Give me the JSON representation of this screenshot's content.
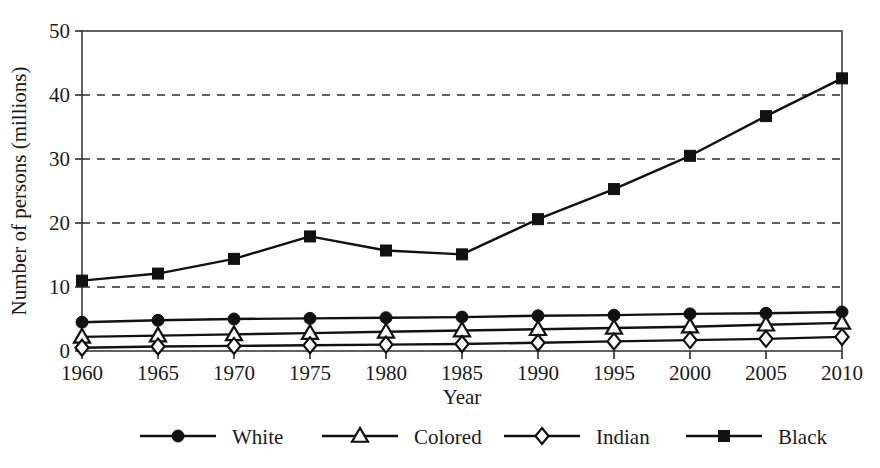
{
  "chart_data": {
    "type": "line",
    "title": "",
    "xlabel": "Year",
    "ylabel": "Number of persons (millions)",
    "x": [
      1960,
      1965,
      1970,
      1975,
      1980,
      1985,
      1990,
      1995,
      2000,
      2005,
      2010
    ],
    "categories": [
      "1960",
      "1965",
      "1970",
      "1975",
      "1980",
      "1985",
      "1990",
      "1995",
      "2000",
      "2005",
      "2010"
    ],
    "xlim": [
      1960,
      2010
    ],
    "ylim": [
      0,
      50
    ],
    "yticks": [
      0,
      10,
      20,
      30,
      40,
      50
    ],
    "ytick_labels": [
      "0",
      "10",
      "20",
      "30",
      "40",
      "50"
    ],
    "grid": "horizontal-dashed",
    "legend_position": "bottom",
    "series": [
      {
        "name": "White",
        "marker": "filled-circle",
        "color": "#111111",
        "values": [
          4.5,
          4.8,
          5.0,
          5.1,
          5.2,
          5.3,
          5.5,
          5.6,
          5.8,
          5.9,
          6.1
        ]
      },
      {
        "name": "Colored",
        "marker": "open-triangle",
        "color": "#111111",
        "values": [
          2.2,
          2.4,
          2.6,
          2.8,
          3.0,
          3.2,
          3.4,
          3.6,
          3.8,
          4.1,
          4.4
        ]
      },
      {
        "name": "Indian",
        "marker": "open-diamond",
        "color": "#111111",
        "values": [
          0.5,
          0.7,
          0.8,
          0.9,
          1.0,
          1.1,
          1.3,
          1.5,
          1.7,
          1.9,
          2.2
        ]
      },
      {
        "name": "Black",
        "marker": "filled-square",
        "color": "#111111",
        "values": [
          11.0,
          12.1,
          14.4,
          17.9,
          15.7,
          15.1,
          20.6,
          25.3,
          30.5,
          36.7,
          42.6
        ]
      }
    ]
  },
  "legend": {
    "items": [
      {
        "label": "White",
        "marker": "filled-circle"
      },
      {
        "label": "Colored",
        "marker": "open-triangle"
      },
      {
        "label": "Indian",
        "marker": "open-diamond"
      },
      {
        "label": "Black",
        "marker": "filled-square"
      }
    ]
  },
  "axes": {
    "y_title": "Number of persons (millions)",
    "x_title": "Year"
  }
}
